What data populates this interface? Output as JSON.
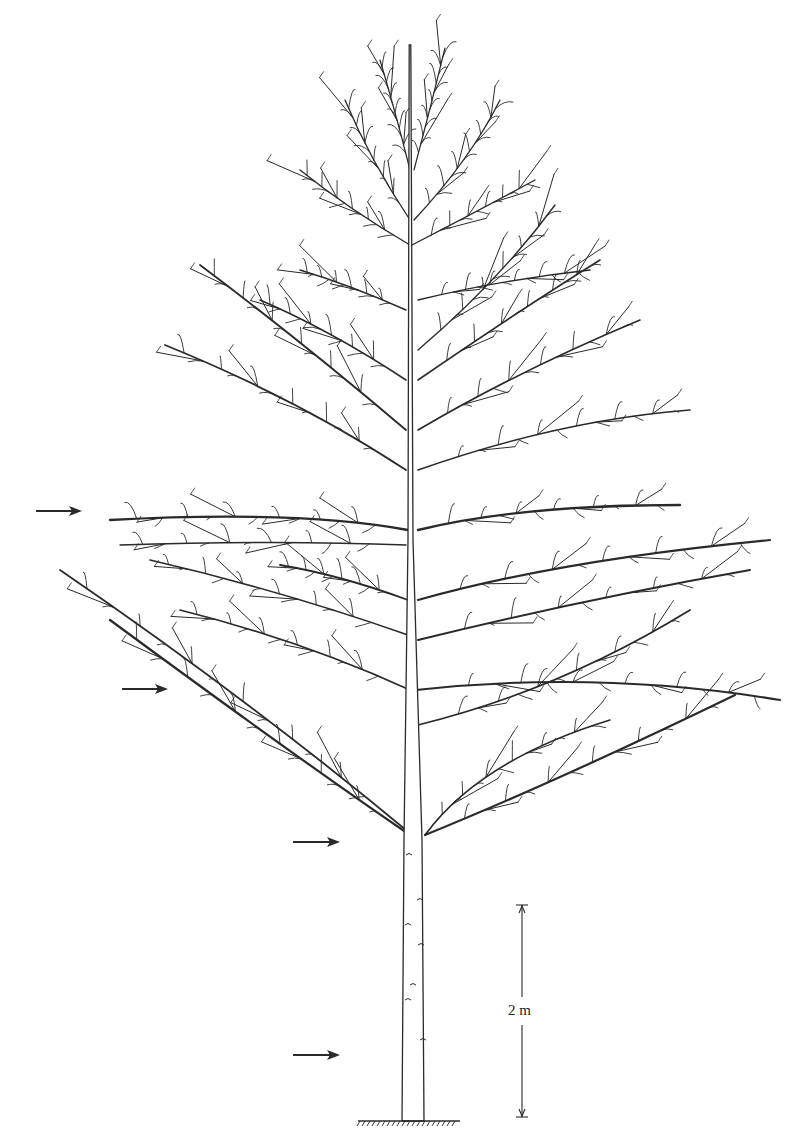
{
  "figure": {
    "type": "botanical-line-drawing",
    "ink_color": "#2a2a2a",
    "background": "#ffffff"
  },
  "scale_bar": {
    "label": "2 m",
    "x": 522,
    "y_top": 905,
    "y_bottom": 1117
  },
  "ground": {
    "x1": 358,
    "x2": 460,
    "y": 1121
  },
  "trunk": {
    "base_x": 413,
    "base_width": 22,
    "top_x": 410,
    "top_y": 45,
    "fork_y": 840
  },
  "arrows": [
    {
      "name": "arrow-tier-1",
      "x1": 36,
      "x2": 82,
      "y": 511
    },
    {
      "name": "arrow-tier-2",
      "x1": 122,
      "x2": 168,
      "y": 689
    },
    {
      "name": "arrow-tier-3",
      "x1": 293,
      "x2": 340,
      "y": 842
    },
    {
      "name": "arrow-tier-4",
      "x1": 293,
      "x2": 340,
      "y": 1055
    }
  ],
  "branches": [
    {
      "sx": 410,
      "sy": 835,
      "ex": 110,
      "ey": 620,
      "c": [
        300,
        760
      ],
      "w": 2.2
    },
    {
      "sx": 412,
      "sy": 835,
      "ex": 60,
      "ey": 570,
      "c": [
        250,
        700
      ],
      "w": 1.8
    },
    {
      "sx": 425,
      "sy": 835,
      "ex": 735,
      "ey": 695,
      "c": [
        560,
        780
      ],
      "w": 2.2
    },
    {
      "sx": 425,
      "sy": 835,
      "ex": 610,
      "ey": 720,
      "c": [
        480,
        760
      ],
      "w": 1.6
    },
    {
      "sx": 418,
      "sy": 725,
      "ex": 690,
      "ey": 610,
      "c": [
        560,
        690
      ],
      "w": 1.8
    },
    {
      "sx": 416,
      "sy": 690,
      "ex": 780,
      "ey": 700,
      "c": [
        600,
        670
      ],
      "w": 2.0
    },
    {
      "sx": 410,
      "sy": 690,
      "ex": 180,
      "ey": 610,
      "c": [
        300,
        640
      ],
      "w": 1.6
    },
    {
      "sx": 418,
      "sy": 640,
      "ex": 750,
      "ey": 570,
      "c": [
        580,
        600
      ],
      "w": 2.0
    },
    {
      "sx": 408,
      "sy": 635,
      "ex": 150,
      "ey": 560,
      "c": [
        280,
        590
      ],
      "w": 1.6
    },
    {
      "sx": 418,
      "sy": 600,
      "ex": 770,
      "ey": 540,
      "c": [
        560,
        560
      ],
      "w": 2.2
    },
    {
      "sx": 408,
      "sy": 600,
      "ex": 280,
      "ey": 565,
      "c": [
        340,
        575
      ],
      "w": 1.8
    },
    {
      "sx": 418,
      "sy": 530,
      "ex": 680,
      "ey": 505,
      "c": [
        520,
        505
      ],
      "w": 2.4
    },
    {
      "sx": 408,
      "sy": 530,
      "ex": 110,
      "ey": 520,
      "c": [
        300,
        510
      ],
      "w": 2.4
    },
    {
      "sx": 406,
      "sy": 545,
      "ex": 120,
      "ey": 545,
      "c": [
        280,
        540
      ],
      "w": 1.4
    },
    {
      "sx": 418,
      "sy": 470,
      "ex": 690,
      "ey": 410,
      "c": [
        560,
        420
      ],
      "w": 1.6
    },
    {
      "sx": 406,
      "sy": 470,
      "ex": 165,
      "ey": 345,
      "c": [
        300,
        400
      ],
      "w": 1.8
    },
    {
      "sx": 418,
      "sy": 430,
      "ex": 640,
      "ey": 320,
      "c": [
        520,
        370
      ],
      "w": 1.6
    },
    {
      "sx": 406,
      "sy": 430,
      "ex": 200,
      "ey": 265,
      "c": [
        300,
        340
      ],
      "w": 1.8
    },
    {
      "sx": 418,
      "sy": 380,
      "ex": 600,
      "ey": 260,
      "c": [
        520,
        310
      ],
      "w": 1.6
    },
    {
      "sx": 406,
      "sy": 380,
      "ex": 260,
      "ey": 300,
      "c": [
        330,
        330
      ],
      "w": 1.6
    },
    {
      "sx": 418,
      "sy": 350,
      "ex": 555,
      "ey": 205,
      "c": [
        500,
        280
      ],
      "w": 1.4
    },
    {
      "sx": 418,
      "sy": 300,
      "ex": 590,
      "ey": 270,
      "c": [
        500,
        280
      ],
      "w": 1.4
    },
    {
      "sx": 406,
      "sy": 310,
      "ex": 300,
      "ey": 270,
      "c": [
        350,
        285
      ],
      "w": 1.4
    },
    {
      "sx": 410,
      "sy": 245,
      "ex": 300,
      "ey": 170,
      "c": [
        350,
        210
      ],
      "w": 1.4
    },
    {
      "sx": 412,
      "sy": 245,
      "ex": 535,
      "ey": 180,
      "c": [
        480,
        210
      ],
      "w": 1.4
    },
    {
      "sx": 410,
      "sy": 220,
      "ex": 345,
      "ey": 100,
      "c": [
        370,
        160
      ],
      "w": 1.3
    },
    {
      "sx": 414,
      "sy": 220,
      "ex": 500,
      "ey": 100,
      "c": [
        470,
        160
      ],
      "w": 1.3
    },
    {
      "sx": 410,
      "sy": 170,
      "ex": 380,
      "ey": 60,
      "c": [
        395,
        110
      ],
      "w": 1.2
    },
    {
      "sx": 414,
      "sy": 170,
      "ex": 445,
      "ey": 48,
      "c": [
        430,
        110
      ],
      "w": 1.2
    }
  ]
}
